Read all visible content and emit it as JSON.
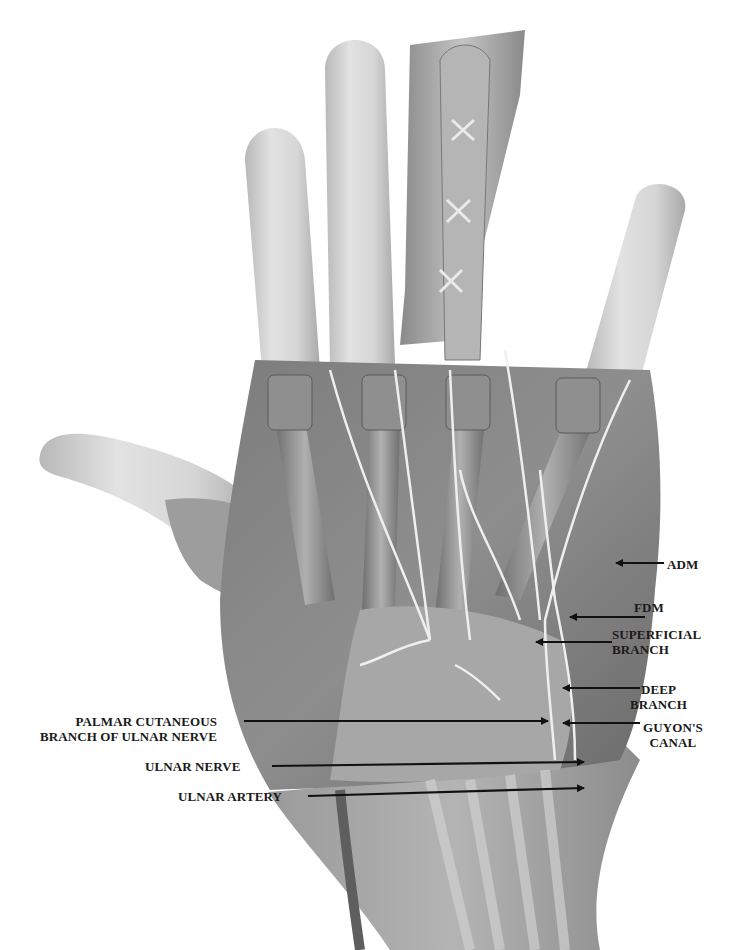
{
  "figure": {
    "width": 741,
    "height": 950,
    "background": "#ffffff"
  },
  "colors": {
    "skin_light": "#d9d9d9",
    "skin_mid": "#bdbdbd",
    "muscle_dark": "#6e6e6e",
    "muscle_mid": "#8a8a8a",
    "tendon": "#a8a8a8",
    "nerve": "#ececec",
    "label_text": "#1a1a1a",
    "arrow": "#111111"
  },
  "labels": [
    {
      "id": "adm",
      "lines": [
        "ADM"
      ],
      "x": 667,
      "y": 557,
      "align": "left",
      "arrow": {
        "from": [
          664,
          563
        ],
        "to": [
          616,
          563
        ]
      }
    },
    {
      "id": "fdm",
      "lines": [
        "FDM"
      ],
      "x": 634,
      "y": 600,
      "align": "left",
      "arrow": {
        "from": [
          645,
          617
        ],
        "to": [
          570,
          617
        ]
      }
    },
    {
      "id": "superficial-branch",
      "lines": [
        "SUPERFICIAL",
        "BRANCH"
      ],
      "x": 612,
      "y": 627,
      "align": "left",
      "arrow": {
        "from": [
          612,
          642
        ],
        "to": [
          536,
          642
        ]
      }
    },
    {
      "id": "deep-branch",
      "lines": [
        "DEEP",
        "BRANCH"
      ],
      "x": 630,
      "y": 682,
      "align": "center",
      "arrow": {
        "from": [
          640,
          688
        ],
        "to": [
          563,
          688
        ]
      }
    },
    {
      "id": "guyons-canal",
      "lines": [
        "GUYON'S",
        "CANAL"
      ],
      "x": 643,
      "y": 720,
      "align": "center",
      "arrow": {
        "from": [
          640,
          723
        ],
        "to": [
          563,
          723
        ]
      }
    },
    {
      "id": "palmar-cutaneous",
      "lines": [
        "PALMAR CUTANEOUS",
        "BRANCH OF ULNAR NERVE"
      ],
      "x": 40,
      "y": 714,
      "align": "right",
      "arrow": {
        "from": [
          244,
          721
        ],
        "to": [
          548,
          721
        ]
      }
    },
    {
      "id": "ulnar-nerve",
      "lines": [
        "ULNAR NERVE"
      ],
      "x": 145,
      "y": 759,
      "align": "right",
      "arrow": {
        "from": [
          272,
          766
        ],
        "to": [
          584,
          762
        ]
      }
    },
    {
      "id": "ulnar-artery",
      "lines": [
        "ULNAR ARTERY"
      ],
      "x": 178,
      "y": 789,
      "align": "right",
      "arrow": {
        "from": [
          308,
          796
        ],
        "to": [
          584,
          788
        ]
      }
    }
  ]
}
